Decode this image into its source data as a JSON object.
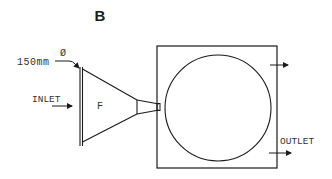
{
  "figure": {
    "panel_label": "B",
    "diameter_symbol": "Ø",
    "diameter_value": "150mm",
    "inlet_label": "INLET",
    "funnel_label": "F",
    "outlet_label": "OUTLET"
  },
  "colors": {
    "line": "#1a1a1a",
    "text": "#333333",
    "background": "#ffffff"
  }
}
